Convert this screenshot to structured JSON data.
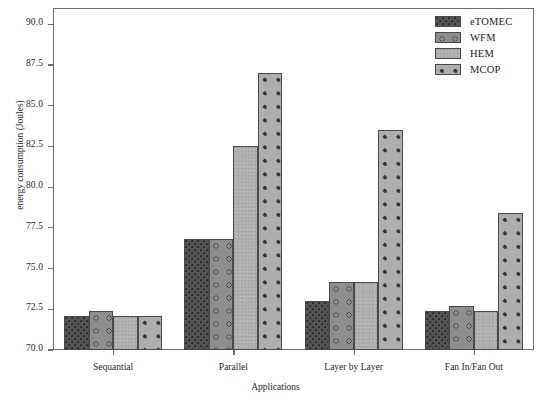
{
  "chart_data": {
    "type": "bar",
    "title": "",
    "xlabel": "Applications",
    "ylabel": "energy consumption (Joules)",
    "categories": [
      "Sequantial",
      "Parallel",
      "Layer by Layer",
      "Fan In/Fan Out"
    ],
    "series": [
      {
        "name": "eTOMEC",
        "values": [
          72.1,
          76.8,
          73.0,
          72.4
        ],
        "color": "#545454",
        "pattern": "dense-dots"
      },
      {
        "name": "WFM",
        "values": [
          72.4,
          76.8,
          74.2,
          72.7
        ],
        "color": "#8d8d8d",
        "pattern": "open-circles"
      },
      {
        "name": "HEM",
        "values": [
          72.1,
          82.5,
          74.2,
          72.4
        ],
        "color": "#b2b2b2",
        "pattern": "speckle"
      },
      {
        "name": "MCOP",
        "values": [
          72.1,
          87.0,
          83.5,
          78.4
        ],
        "color": "#aeaeae",
        "pattern": "sparse-dots"
      }
    ],
    "ylim": [
      70.0,
      91.0
    ],
    "yticks": [
      70.0,
      72.5,
      75.0,
      77.5,
      80.0,
      82.5,
      85.0,
      87.5,
      90.0
    ],
    "ytick_labels": [
      "70.0",
      "72.5",
      "75.0",
      "77.5",
      "80.0",
      "82.5",
      "85.0",
      "87.5",
      "90.0"
    ],
    "grid": false,
    "legend_position": "top-right",
    "legend_entries": [
      "eTOMEC",
      "WFM",
      "HEM",
      "MCOP"
    ]
  }
}
